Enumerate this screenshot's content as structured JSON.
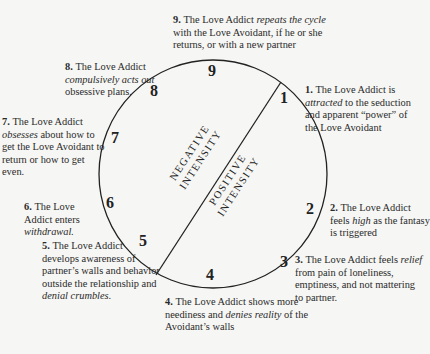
{
  "diagram": {
    "type": "cycle",
    "center_labels": {
      "negative": [
        "NEGATIVE",
        "INTENSITY"
      ],
      "positive": [
        "POSITIVE",
        "INTENSITY"
      ]
    },
    "stages": [
      {
        "n": "1",
        "num_label": "1.",
        "parts": [
          {
            "t": "The Love Addict is "
          },
          {
            "t": "attracted",
            "i": true
          },
          {
            "t": " to the seduction and apparent “power” of the Love Avoidant"
          }
        ]
      },
      {
        "n": "2",
        "num_label": "2.",
        "parts": [
          {
            "t": "The Love Addict feels "
          },
          {
            "t": "high",
            "i": true
          },
          {
            "t": " as the fantasy is triggered"
          }
        ]
      },
      {
        "n": "3",
        "num_label": "3.",
        "parts": [
          {
            "t": "The Love Addict feels "
          },
          {
            "t": "relief",
            "i": true
          },
          {
            "t": " from pain of loneliness, emptiness, and not mattering to partner."
          }
        ]
      },
      {
        "n": "4",
        "num_label": "4.",
        "parts": [
          {
            "t": "The Love Addict shows more neediness and "
          },
          {
            "t": "denies reality",
            "i": true
          },
          {
            "t": " of the Avoidant’s walls"
          }
        ]
      },
      {
        "n": "5",
        "num_label": "5.",
        "parts": [
          {
            "t": "The Love Addict develops awareness of partner’s walls and behavior outside the relationship and "
          },
          {
            "t": "denial crumbles.",
            "i": true
          }
        ]
      },
      {
        "n": "6",
        "num_label": "6.",
        "parts": [
          {
            "t": "The Love Addict enters "
          },
          {
            "t": "withdrawal.",
            "i": true
          }
        ]
      },
      {
        "n": "7",
        "num_label": "7.",
        "parts": [
          {
            "t": "The Love Addict "
          },
          {
            "t": "obsesses",
            "i": true
          },
          {
            "t": " about how to get the Love Avoidant to return or how to get even."
          }
        ]
      },
      {
        "n": "8",
        "num_label": "8.",
        "parts": [
          {
            "t": "The Love Addict "
          },
          {
            "t": "compulsively acts out",
            "i": true
          },
          {
            "t": " obsessive plans."
          }
        ]
      },
      {
        "n": "9",
        "num_label": "9.",
        "parts": [
          {
            "t": "The Love Addict "
          },
          {
            "t": "repeats the cycle",
            "i": true
          },
          {
            "t": " with the Love Avoidant, if he or she returns, or with a new partner"
          }
        ]
      }
    ]
  }
}
